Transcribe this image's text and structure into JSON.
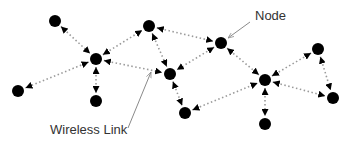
{
  "diagram": {
    "colors": {
      "background": "#ffffff",
      "node": "#000000",
      "link": "#9a9a9a",
      "arrowhead": "#000000",
      "callout": "#8a8a8a",
      "label": "#333333"
    },
    "nodes": [
      {
        "id": "n1",
        "x": 55,
        "y": 21
      },
      {
        "id": "n2",
        "x": 96,
        "y": 59
      },
      {
        "id": "n3",
        "x": 149,
        "y": 26
      },
      {
        "id": "n4",
        "x": 221,
        "y": 43
      },
      {
        "id": "n5",
        "x": 18,
        "y": 91
      },
      {
        "id": "n6",
        "x": 96,
        "y": 101
      },
      {
        "id": "n7",
        "x": 170,
        "y": 74
      },
      {
        "id": "n8",
        "x": 265,
        "y": 80
      },
      {
        "id": "n9",
        "x": 318,
        "y": 49
      },
      {
        "id": "n10",
        "x": 185,
        "y": 113
      },
      {
        "id": "n11",
        "x": 333,
        "y": 98
      },
      {
        "id": "n12",
        "x": 265,
        "y": 124
      }
    ],
    "links": [
      [
        "n1",
        "n2"
      ],
      [
        "n2",
        "n3"
      ],
      [
        "n2",
        "n5"
      ],
      [
        "n2",
        "n6"
      ],
      [
        "n2",
        "n7"
      ],
      [
        "n3",
        "n4"
      ],
      [
        "n3",
        "n7"
      ],
      [
        "n4",
        "n7"
      ],
      [
        "n4",
        "n8"
      ],
      [
        "n7",
        "n10"
      ],
      [
        "n10",
        "n8"
      ],
      [
        "n8",
        "n12"
      ],
      [
        "n8",
        "n11"
      ],
      [
        "n9",
        "n8"
      ],
      [
        "n9",
        "n11"
      ]
    ],
    "callouts": {
      "node": {
        "text": "Node",
        "text_x": 255,
        "text_y": 20,
        "from": [
          250,
          22
        ],
        "to": [
          228,
          38
        ]
      },
      "link": {
        "text": "Wireless Link",
        "text_x": 50,
        "text_y": 134,
        "from": [
          128,
          128
        ],
        "to": [
          151,
          72
        ]
      }
    }
  }
}
